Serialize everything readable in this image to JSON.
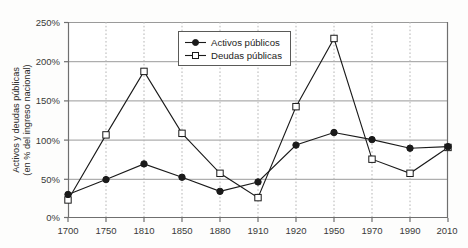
{
  "chart_data": {
    "type": "line",
    "title": "",
    "subtitle": "",
    "xlabel": "",
    "ylabel": "Activos y deudas públicas\n(en % del ingreso nacional)",
    "ylabel_line1": "Activos y deudas públicas",
    "ylabel_line2": "(en % del ingreso nacional)",
    "categories": [
      "1700",
      "1750",
      "1810",
      "1850",
      "1880",
      "1910",
      "1920",
      "1950",
      "1970",
      "1990",
      "2010"
    ],
    "x": [
      1700,
      1750,
      1810,
      1850,
      1880,
      1910,
      1920,
      1950,
      1970,
      1990,
      2010
    ],
    "series": [
      {
        "name": "Activos públicos",
        "marker": "filled-circle",
        "color": "#1a1a1a",
        "values": [
          30,
          49,
          69,
          52,
          34,
          46,
          93,
          109,
          100,
          89,
          91
        ]
      },
      {
        "name": "Deudas públicas",
        "marker": "open-square",
        "color": "#1a1a1a",
        "values": [
          23,
          106,
          187,
          108,
          57,
          26,
          142,
          229,
          75,
          57,
          90
        ]
      }
    ],
    "ylim": [
      0,
      250
    ],
    "yticks": [
      0,
      50,
      100,
      150,
      200,
      250
    ],
    "ytick_labels": [
      "0%",
      "50%",
      "100%",
      "150%",
      "200%",
      "250%"
    ],
    "xtick_labels": [
      "1700",
      "1750",
      "1810",
      "1850",
      "1880",
      "1910",
      "1920",
      "1950",
      "1970",
      "1990",
      "2010"
    ],
    "grid": {
      "horizontal": true,
      "vertical": true,
      "horizontal_style": "solid-gray",
      "vertical_style": "dotted-gray"
    },
    "legend": {
      "position": "top-center",
      "entries": [
        {
          "label": "Activos públicos",
          "marker": "filled-circle"
        },
        {
          "label": "Deudas públicas",
          "marker": "open-square"
        }
      ]
    },
    "colors": {
      "line": "#1a1a1a",
      "grid_horizontal": "#9a9a9a",
      "grid_vertical": "#b5b5b5",
      "axis": "#6f6f6f",
      "text": "#231f20",
      "background": "#fdfdfc",
      "legend_border": "#5a5a58"
    }
  }
}
